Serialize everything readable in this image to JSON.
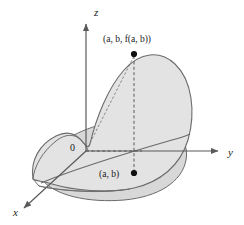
{
  "figure": {
    "background_color": "#ffffff",
    "width": 244,
    "height": 225
  },
  "colors": {
    "surface_fill": "#e3e3e3",
    "domain_fill": "#d8d8d8",
    "outline": "#6b6b6b",
    "axis": "#5a5a5a",
    "dashed": "#4a4a4a",
    "text": "#1a1a1a",
    "point": "#111111"
  },
  "axes": [
    {
      "id": "z",
      "label": "z",
      "label_x": 94,
      "label_y": 16,
      "direction": "up",
      "arrow": true
    },
    {
      "id": "y",
      "label": "y",
      "label_x": 228,
      "label_y": 156,
      "direction": "right",
      "arrow": true
    },
    {
      "id": "x",
      "label": "x",
      "label_x": 13,
      "label_y": 216,
      "direction": "down-left",
      "arrow": true
    }
  ],
  "origin": {
    "label": "0",
    "label_x": 70,
    "label_y": 151,
    "x": 86,
    "y": 151
  },
  "points": [
    {
      "id": "surface-point",
      "label": "(a, b, f(a, b))",
      "label_parts": {
        "prefix": "(",
        "a": "a",
        "sep1": ", ",
        "b": "b",
        "sep2": ", ",
        "f": "f",
        "arg": "(a, b)",
        "suffix": ")"
      },
      "x": 134,
      "y": 54,
      "label_x": 103,
      "label_y": 42,
      "radius": 3
    },
    {
      "id": "domain-point",
      "label": "(a, b)",
      "x": 134,
      "y": 173,
      "label_x": 99,
      "label_y": 177,
      "radius": 3
    }
  ],
  "connectors": [
    {
      "id": "vertical-dashed-connector",
      "style": "dashed",
      "from": [
        134,
        54
      ],
      "to": [
        134,
        173
      ]
    },
    {
      "id": "horizontal-dashed-connector",
      "style": "dashed",
      "from": [
        86,
        151
      ],
      "to": [
        140,
        151
      ]
    },
    {
      "id": "surface-trace-dashed",
      "style": "dashed",
      "from": [
        86,
        151
      ],
      "to": [
        134,
        54
      ]
    }
  ],
  "surface": {
    "id": "function-surface",
    "description": "Curved sheet z = f(x, y) rising above the domain",
    "fill": "#e3e3e3",
    "stroke": "#6b6b6b"
  },
  "domain": {
    "id": "domain-region",
    "description": "Planar region in the xy-plane beneath the surface",
    "fill": "#d8d8d8",
    "stroke": "#6b6b6b"
  }
}
